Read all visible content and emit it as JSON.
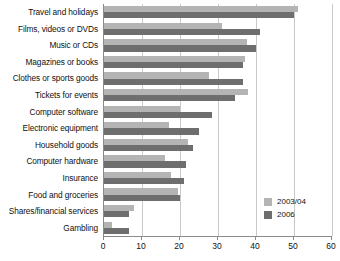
{
  "chart_data": {
    "type": "bar",
    "orientation": "horizontal",
    "title": "",
    "subtitle": "",
    "xlabel": "",
    "ylabel": "",
    "xlim": [
      0,
      60
    ],
    "xticks": [
      0,
      10,
      20,
      30,
      40,
      50,
      60
    ],
    "xtick_labels": [
      "0",
      "10",
      "20",
      "30",
      "40",
      "50",
      "60"
    ],
    "grid": true,
    "grid_axis": "x",
    "legend_position": "bottom-right",
    "categories": [
      "Travel and holidays",
      "Films, videos or DVDs",
      "Music or CDs",
      "Magazines or books",
      "Clothes or sports goods",
      "Tickets for events",
      "Computer software",
      "Electronic equipment",
      "Household goods",
      "Computer hardware",
      "Insurance",
      "Food and groceries",
      "Shares/financial services",
      "Gambling"
    ],
    "series": [
      {
        "name": "2003/04",
        "color": "#b4b4b4",
        "values": [
          51,
          31,
          37.5,
          37,
          27.5,
          38,
          20,
          17,
          22,
          16,
          17.5,
          19.5,
          8,
          2
        ]
      },
      {
        "name": "2006",
        "color": "#6e6e6e",
        "values": [
          50,
          41,
          40,
          36.5,
          36.5,
          34.5,
          28.5,
          25,
          23.5,
          21.5,
          21,
          20,
          6.5,
          6.5
        ]
      }
    ]
  },
  "legend": {
    "entries": [
      {
        "label": "2003/04",
        "color": "#b4b4b4"
      },
      {
        "label": "2006",
        "color": "#6e6e6e"
      }
    ]
  }
}
